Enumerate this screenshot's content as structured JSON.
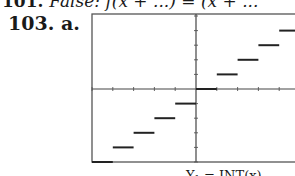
{
  "problem_prev": {
    "number": "101.",
    "text": "False: f(x + ...) = (x + ..."
  },
  "problem": {
    "number": "103.",
    "part": "a."
  },
  "caption_partial": "Y₁ = INT(x)",
  "chart_data": {
    "type": "step",
    "title": "",
    "function": "greatest integer function f(x) = [[x]]",
    "xlabel": "",
    "ylabel": "",
    "xlim": [
      -5,
      5
    ],
    "ylim": [
      -5,
      5
    ],
    "grid": false,
    "x_tick_spacing": 1,
    "y_tick_spacing": 1,
    "segments": [
      {
        "x": [
          -5,
          -4
        ],
        "y": -5
      },
      {
        "x": [
          -4,
          -3
        ],
        "y": -4
      },
      {
        "x": [
          -3,
          -2
        ],
        "y": -3
      },
      {
        "x": [
          -2,
          -1
        ],
        "y": -2
      },
      {
        "x": [
          -1,
          0
        ],
        "y": -1
      },
      {
        "x": [
          0,
          1
        ],
        "y": 0
      },
      {
        "x": [
          1,
          2
        ],
        "y": 1
      },
      {
        "x": [
          2,
          3
        ],
        "y": 2
      },
      {
        "x": [
          3,
          4
        ],
        "y": 3
      },
      {
        "x": [
          4,
          5
        ],
        "y": 4
      }
    ]
  }
}
